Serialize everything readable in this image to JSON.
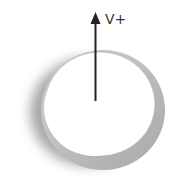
{
  "diagram": {
    "arrow": {
      "label": "V+",
      "direction": "up",
      "color": "#222222"
    },
    "ring": {
      "fill_color": "#b8b8b8",
      "shadow_color": "#707070",
      "inner_color": "#ffffff"
    }
  }
}
